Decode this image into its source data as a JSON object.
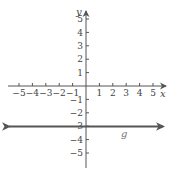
{
  "chart_data": {
    "type": "line",
    "title": "",
    "xlabel": "x",
    "ylabel": "y",
    "xlim": [
      -5.5,
      5.9
    ],
    "ylim": [
      -6.1,
      5.5
    ],
    "x_ticks": [
      -5,
      -4,
      -3,
      -2,
      -1,
      1,
      2,
      3,
      4,
      5
    ],
    "y_ticks": [
      5,
      4,
      3,
      2,
      1,
      -1,
      -2,
      -3,
      -4,
      -5
    ],
    "x_tick_labels": [
      "−5",
      "−4",
      "−3",
      "−2",
      "−1",
      "1",
      "2",
      "3",
      "4",
      "5"
    ],
    "y_tick_labels": [
      "5",
      "4",
      "3",
      "2",
      "1",
      "−1",
      "−2",
      "−3",
      "−4",
      "−5"
    ],
    "grid": false,
    "legend": null,
    "series": [
      {
        "name": "g",
        "equation": "y = -3",
        "x": [
          -5.8,
          5.8
        ],
        "y": [
          -3,
          -3
        ],
        "arrows_both_ends": true,
        "label_position": {
          "x": 2.8,
          "y": -3.7
        }
      }
    ]
  },
  "colors": {
    "axis": "#555555",
    "line": "#555555",
    "label": "#444444",
    "series_label": "#777777"
  }
}
